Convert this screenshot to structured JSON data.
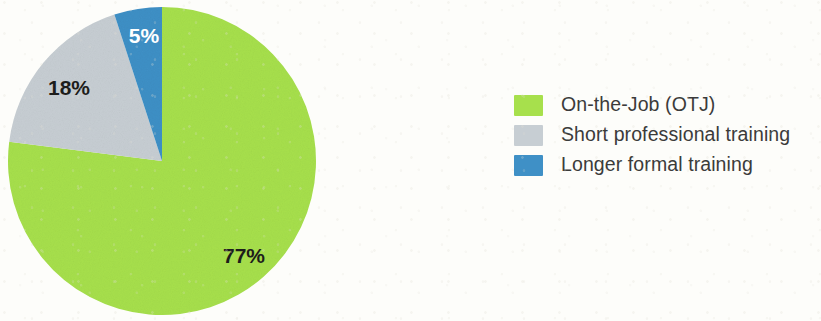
{
  "chart_data": {
    "type": "pie",
    "title": "",
    "subtitle": "",
    "xlabel": "",
    "ylabel": "",
    "legend_position": "right",
    "grid": false,
    "categories": [
      "On-the-Job (OTJ)",
      "Short professional training",
      "Longer formal training"
    ],
    "values": [
      77,
      18,
      5
    ],
    "value_unit": "%",
    "data_labels": [
      "77%",
      "18%",
      "5%"
    ],
    "colors": [
      "#a7e04c",
      "#c7ced3",
      "#3f90c6"
    ],
    "label_colors": [
      "#1d1d1b",
      "#1d1d1b",
      "#ffffff"
    ],
    "start_angle_deg": 0,
    "direction": "clockwise",
    "slices": [
      {
        "name": "On-the-Job (OTJ)",
        "value": 77,
        "label": "77%",
        "color": "#a7e04c",
        "label_color": "#1d1d1b",
        "start_deg": 0,
        "end_deg": 277.2,
        "label_x": 237,
        "label_y": 250,
        "label_size": 21
      },
      {
        "name": "Short professional training",
        "value": 18,
        "label": "18%",
        "color": "#c7ced3",
        "label_color": "#1d1d1b",
        "start_deg": 277.2,
        "end_deg": 342.0,
        "label_x": 62,
        "label_y": 82,
        "label_size": 21
      },
      {
        "name": "Longer formal training",
        "value": 5,
        "label": "5%",
        "color": "#3f90c6",
        "label_color": "#ffffff",
        "start_deg": 342.0,
        "end_deg": 360.0,
        "label_x": 137,
        "label_y": 30,
        "label_size": 21
      }
    ]
  },
  "legend": {
    "items": [
      {
        "label": "On-the-Job (OTJ)",
        "color": "#a7e04c"
      },
      {
        "label": "Short professional training",
        "color": "#c7ced3"
      },
      {
        "label": "Longer formal training",
        "color": "#3f90c6"
      }
    ]
  },
  "geometry": {
    "center_x": 155,
    "center_y": 156,
    "radius": 154
  },
  "colors": {
    "background": "#fdfdfa",
    "green": "#a7e04c",
    "gray": "#c7ced3",
    "blue": "#3f90c6",
    "label_dark": "#1d1d1b",
    "label_light": "#ffffff",
    "legend_text": "#3b3b3a"
  }
}
